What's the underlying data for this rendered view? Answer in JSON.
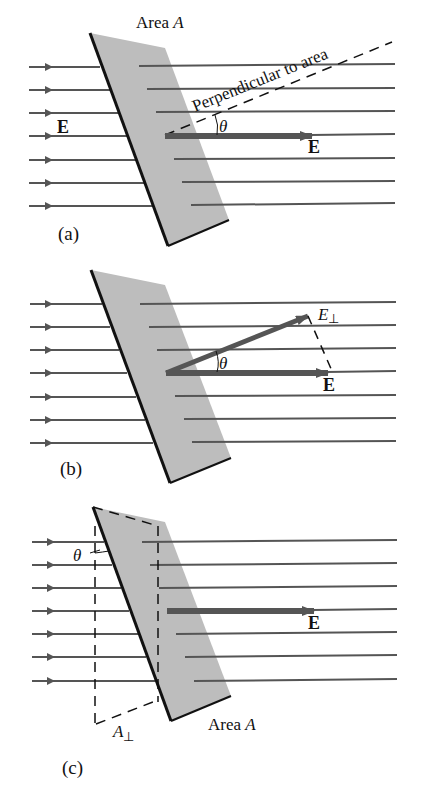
{
  "colors": {
    "plate": "#bdbdbd",
    "field_line": "#555555",
    "plate_edge": "#111111",
    "vector": "#555555",
    "background": "#ffffff"
  },
  "panel_a": {
    "caption": "(a)",
    "area_label_prefix": "Area ",
    "area_label_var": "A",
    "perpendicular_label": "Perpendicular to area",
    "field_label_left": "E",
    "field_vector_label": "E",
    "angle_label": "θ"
  },
  "panel_b": {
    "caption": "(b)",
    "perp_component_label": "E",
    "perp_component_sub": "⊥",
    "field_vector_label": "E",
    "angle_label": "θ"
  },
  "panel_c": {
    "caption": "(c)",
    "area_label_prefix": "Area ",
    "area_label_var": "A",
    "projected_area_label": "A",
    "projected_area_sub": "⊥",
    "field_vector_label": "E",
    "angle_label": "θ"
  }
}
